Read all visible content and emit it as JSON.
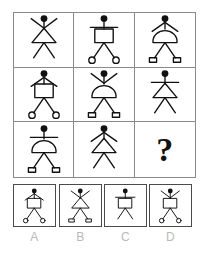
{
  "puzzle": {
    "type": "visual-analogy-matrix",
    "title": "",
    "grid": {
      "rows": 3,
      "cols": 3
    },
    "attributes": {
      "arms": [
        "up-v",
        "horizontal",
        "down-v"
      ],
      "body": [
        "triangle",
        "rectangle",
        "dome"
      ],
      "feet": [
        "plain",
        "circle",
        "rectangle"
      ]
    },
    "colors": {
      "ink": "#111111",
      "grid_line": "#8a8a8a",
      "option_border": "#4a4a4a",
      "label_text": "#b9b9b9",
      "background": "#ffffff"
    },
    "cells": [
      {
        "id": "r1c1",
        "arms": "up-v",
        "body": "triangle",
        "feet": "plain",
        "is_question": false
      },
      {
        "id": "r1c2",
        "arms": "horizontal",
        "body": "rectangle",
        "feet": "circle",
        "is_question": false
      },
      {
        "id": "r1c3",
        "arms": "down-v",
        "body": "dome",
        "feet": "rectangle",
        "is_question": false
      },
      {
        "id": "r2c1",
        "arms": "down-v",
        "body": "rectangle",
        "feet": "circle",
        "is_question": false
      },
      {
        "id": "r2c2",
        "arms": "up-v",
        "body": "dome",
        "feet": "rectangle",
        "is_question": false
      },
      {
        "id": "r2c3",
        "arms": "horizontal",
        "body": "triangle",
        "feet": "plain",
        "is_question": false
      },
      {
        "id": "r3c1",
        "arms": "horizontal",
        "body": "dome",
        "feet": "rectangle",
        "is_question": false
      },
      {
        "id": "r3c2",
        "arms": "down-v",
        "body": "triangle",
        "feet": "plain",
        "is_question": false
      },
      {
        "id": "r3c3",
        "arms": "",
        "body": "",
        "feet": "",
        "is_question": true,
        "marker": "?"
      }
    ],
    "options": [
      {
        "label": "A",
        "arms": "down-v",
        "body": "rectangle",
        "feet": "circle"
      },
      {
        "label": "B",
        "arms": "up-v",
        "body": "triangle",
        "feet": "rectangle"
      },
      {
        "label": "C",
        "arms": "horizontal",
        "body": "rectangle",
        "feet": "plain"
      },
      {
        "label": "D",
        "arms": "up-v",
        "body": "rectangle",
        "feet": "circle"
      }
    ]
  }
}
